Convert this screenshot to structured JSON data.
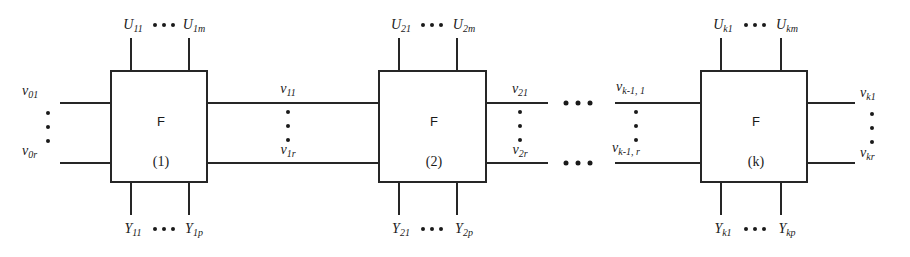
{
  "diagram": {
    "kind": "cascade-block-diagram",
    "block_function_name": "F",
    "colors": {
      "ink": "#262626",
      "background": "#ffffff"
    },
    "blocks": [
      {
        "id": "block-1",
        "function_label": "F",
        "index_label": "(1)",
        "top_inputs": {
          "first": "U",
          "first_sub": "11",
          "last": "U",
          "last_sub": "1m",
          "ellipsis": "•••"
        },
        "bottom_outputs": {
          "first": "Y",
          "first_sub": "11",
          "last": "Y",
          "last_sub": "1p",
          "ellipsis": "•••"
        },
        "left_inputs": {
          "first": "v",
          "first_sub": "01",
          "last": "v",
          "last_sub": "0r"
        },
        "right_outputs": {
          "first": "v",
          "first_sub": "11",
          "last": "v",
          "last_sub": "1r"
        }
      },
      {
        "id": "block-2",
        "function_label": "F",
        "index_label": "(2)",
        "top_inputs": {
          "first": "U",
          "first_sub": "21",
          "last": "U",
          "last_sub": "2m",
          "ellipsis": "•••"
        },
        "bottom_outputs": {
          "first": "Y",
          "first_sub": "21",
          "last": "Y",
          "last_sub": "2p",
          "ellipsis": "•••"
        },
        "left_inputs": {
          "first": "v",
          "first_sub": "11",
          "last": "v",
          "last_sub": "1r"
        },
        "right_outputs": {
          "first": "v",
          "first_sub": "21",
          "last": "v",
          "last_sub": "2r"
        }
      },
      {
        "id": "block-k",
        "function_label": "F",
        "index_label": "(k)",
        "top_inputs": {
          "first": "U",
          "first_sub": "k1",
          "last": "U",
          "last_sub": "km",
          "ellipsis": "•••"
        },
        "bottom_outputs": {
          "first": "Y",
          "first_sub": "k1",
          "last": "Y",
          "last_sub": "kp",
          "ellipsis": "•••"
        },
        "left_inputs": {
          "first": "v",
          "first_sub": "k-1, 1",
          "last": "v",
          "last_sub": "k-1, r"
        },
        "right_outputs": {
          "first": "v",
          "first_sub": "k1",
          "last": "v",
          "last_sub": "kr"
        }
      }
    ],
    "stage_gap_ellipsis": {
      "top_line": "•••",
      "bottom_line": "•••"
    },
    "vertical_ellipsis_dot_count": 3
  }
}
